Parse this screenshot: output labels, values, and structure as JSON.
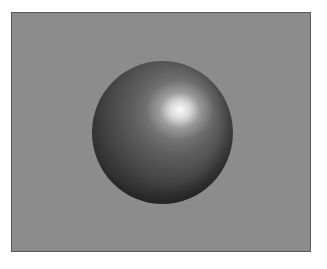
{
  "scene": {
    "description": "Rendered shaded sphere on gray background",
    "background_color": "#8c8c8c",
    "sphere_color": "#3a3a3a",
    "highlight_color": "#ffffff"
  }
}
